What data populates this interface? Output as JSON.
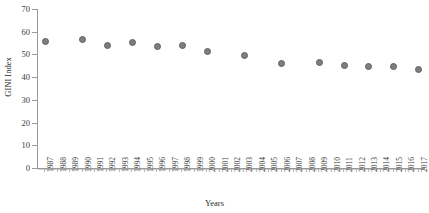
{
  "chart_data": {
    "type": "scatter",
    "title": "",
    "xlabel": "Years",
    "ylabel": "GINI Index",
    "xlim": [
      1987,
      2017
    ],
    "ylim": [
      0,
      70
    ],
    "yticks": [
      0,
      10,
      20,
      30,
      40,
      50,
      60,
      70
    ],
    "grid": false,
    "legend": null,
    "marker_color": "#7e7e7e",
    "axis_color": "#9a9a9a",
    "categories": [
      "1987",
      "1988",
      "1989",
      "1990",
      "1991",
      "1992",
      "1993",
      "1994",
      "1995",
      "1996",
      "1997",
      "1998",
      "1999",
      "2000",
      "2001",
      "2002",
      "2003",
      "2004",
      "2005",
      "2006",
      "2007",
      "2008",
      "2009",
      "2010",
      "2011",
      "2012",
      "2013",
      "2014",
      "2015",
      "2016",
      "2017"
    ],
    "points": [
      {
        "x": "1987",
        "y": 56.1
      },
      {
        "x": "1990",
        "y": 56.9
      },
      {
        "x": "1992",
        "y": 54.2
      },
      {
        "x": "1994",
        "y": 55.8
      },
      {
        "x": "1996",
        "y": 54.0
      },
      {
        "x": "1998",
        "y": 54.5
      },
      {
        "x": "2000",
        "y": 51.6
      },
      {
        "x": "2003",
        "y": 50.0
      },
      {
        "x": "2006",
        "y": 46.4
      },
      {
        "x": "2009",
        "y": 47.0
      },
      {
        "x": "2011",
        "y": 45.5
      },
      {
        "x": "2013",
        "y": 45.0
      },
      {
        "x": "2015",
        "y": 45.3
      },
      {
        "x": "2017",
        "y": 43.8
      }
    ],
    "values_by_category": {
      "1987": 56.1,
      "1988": null,
      "1989": null,
      "1990": 56.9,
      "1991": null,
      "1992": 54.2,
      "1993": null,
      "1994": 55.8,
      "1995": null,
      "1996": 54.0,
      "1997": null,
      "1998": 54.5,
      "1999": null,
      "2000": 51.6,
      "2001": null,
      "2002": null,
      "2003": 50.0,
      "2004": null,
      "2005": null,
      "2006": 46.4,
      "2007": null,
      "2008": null,
      "2009": 47.0,
      "2010": null,
      "2011": 45.5,
      "2012": null,
      "2013": 45.0,
      "2014": null,
      "2015": 45.3,
      "2016": null,
      "2017": 43.8
    }
  },
  "top_clip_ghost": "· · · ·"
}
